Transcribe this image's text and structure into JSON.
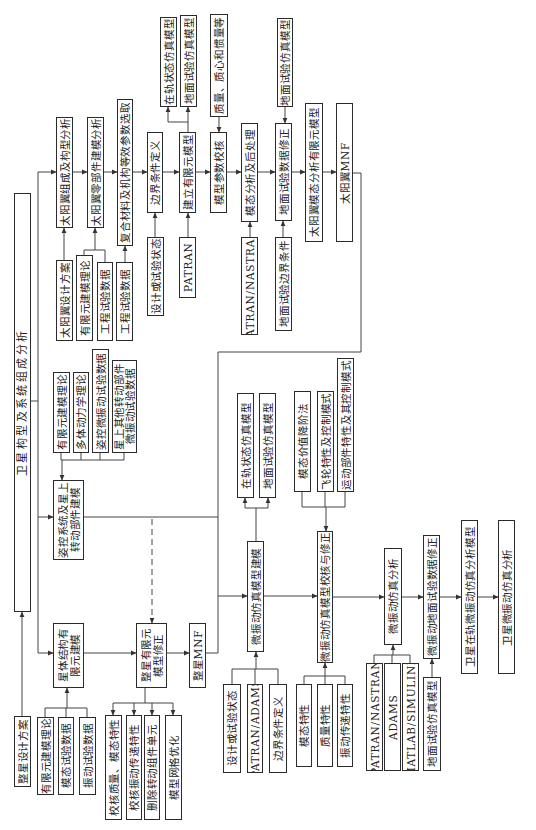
{
  "diagram": {
    "root": {
      "system_analysis": "卫星构型及系统组成分析",
      "satellite_design": "整星设计方案"
    },
    "solar_wing": {
      "steps": [
        "太阳翼组成及构型分析",
        "太阳翼零部件建模分析",
        "复合材料及机构等效参数选取",
        "边界条件定义",
        "建立有限元模型",
        "模型参数校核",
        "模态分析及后处理",
        "地面试验数据修正",
        "太阳翼模态分析有限元模型",
        "太阳翼MNF"
      ],
      "fem_outputs": [
        "在轨状态仿真模型",
        "地面试验仿真模型"
      ],
      "check_input": "质量、质心和惯量等",
      "correction_input": "地面试验仿真模型",
      "inputs": [
        "太阳翼设计方案",
        "有限元建模理论",
        "工程试验数据",
        "工程试验数据",
        "设计或试验状态",
        "PATRAN",
        "PATRAN/NASTRAN",
        "地面试验边界条件"
      ]
    },
    "attitude": {
      "model": "姿控系统及星上\n转动部件建模",
      "inputs": [
        "有限元建模理论",
        "多体动力学理论",
        "姿控微振动试验数据",
        "星上其他转动部件\n微振动试验数据"
      ]
    },
    "whole_satellite": {
      "structure_fem": "星体结构有\n限元建模",
      "structure_inputs": [
        "有限元建模理论",
        "模态试验数据",
        "振动试验数据"
      ],
      "fem_correction": "整星有限元\n模型修正",
      "correction_items": [
        "校核质量、模态特性",
        "校核振动传递特性",
        "删除转动组件单元",
        "模型网格优化"
      ],
      "mnf": "整星MNF"
    },
    "micro_vibration": {
      "modeling": "微振动仿真模型建模",
      "modeling_outputs": [
        "在轨状态仿真模型",
        "地面试验仿真模型"
      ],
      "modeling_inputs": [
        "设计或试验状态",
        "PATRAN/ADAMS",
        "边界条件定义"
      ],
      "verification": "微振动仿真模型校核与修正",
      "verification_methods": [
        "模态价值降阶法",
        "飞轮特性及控制模式",
        "运动部件特性及其控制模式"
      ],
      "verification_inputs": [
        "模态特性",
        "质量特性",
        "振动传递特性"
      ],
      "analysis": "微振动仿真分析",
      "analysis_tools": [
        "PATRAN/NASTRAN",
        "ADAMS",
        "MATLAB/SIMULINK"
      ],
      "ground_correction": "微振动地面试验数据修正",
      "ground_correction_input": "地面试验仿真模型",
      "onorbit_model": "卫星在轨微振动仿真分析模型",
      "final_analysis": "卫星微振动仿真分析"
    }
  }
}
